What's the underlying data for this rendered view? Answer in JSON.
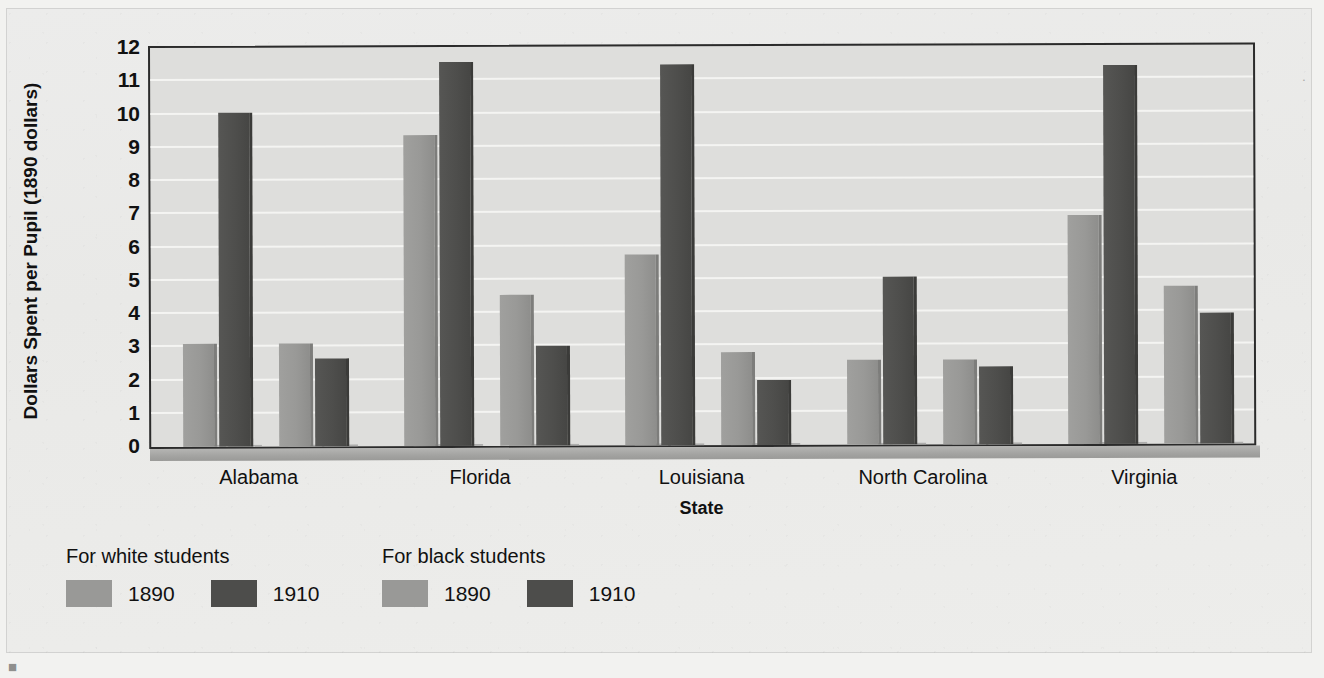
{
  "chart_data": {
    "type": "bar",
    "title": "",
    "xlabel": "State",
    "ylabel": "Dollars Spent per Pupil (1890 dollars)",
    "ylim": [
      0,
      12
    ],
    "ytick_step": 1,
    "grid": true,
    "legend_position": "below-left",
    "categories": [
      "Alabama",
      "Florida",
      "Louisiana",
      "North Carolina",
      "Virginia"
    ],
    "ytick_labels": [
      "12",
      "11",
      "10",
      "9",
      "8",
      "7",
      "6",
      "5",
      "4",
      "3",
      "2",
      "1",
      "0"
    ],
    "series": [
      {
        "name": "For white students 1890",
        "group": "For white students",
        "year": "1890",
        "shade": "light",
        "color": "#999997",
        "values": [
          3.1,
          9.35,
          5.75,
          2.55,
          6.9
        ]
      },
      {
        "name": "For white students 1910",
        "group": "For white students",
        "year": "1910",
        "shade": "dark",
        "color": "#4d4d4b",
        "values": [
          10.05,
          11.55,
          11.45,
          5.05,
          11.4
        ]
      },
      {
        "name": "For black students 1890",
        "group": "For black students",
        "year": "1890",
        "shade": "light",
        "color": "#999997",
        "values": [
          3.1,
          4.55,
          2.8,
          2.55,
          4.75
        ]
      },
      {
        "name": "For black students 1910",
        "group": "For black students",
        "year": "1910",
        "shade": "dark",
        "color": "#4d4d4b",
        "values": [
          2.65,
          3.0,
          1.95,
          2.35,
          3.95
        ]
      }
    ]
  },
  "legend": {
    "blocks": [
      {
        "heading": "For white students",
        "entries": [
          {
            "year": "1890",
            "shade": "light"
          },
          {
            "year": "1910",
            "shade": "dark"
          }
        ]
      },
      {
        "heading": "For black students",
        "entries": [
          {
            "year": "1890",
            "shade": "light"
          },
          {
            "year": "1910",
            "shade": "dark"
          }
        ]
      }
    ]
  },
  "page": {
    "corner_mark_top_right": "·",
    "corner_mark_bottom_left": "■"
  }
}
